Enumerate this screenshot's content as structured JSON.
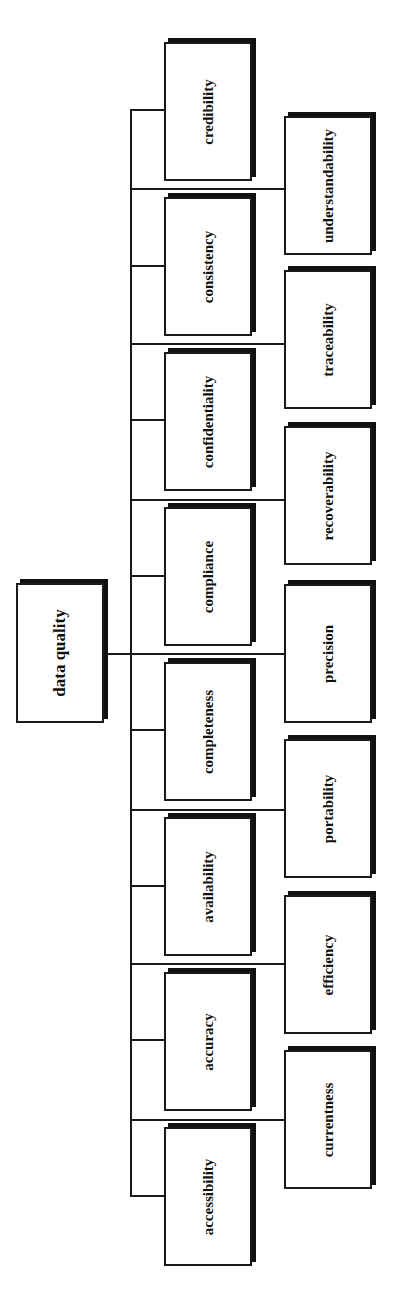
{
  "diagram": {
    "type": "tree",
    "orientation": "rotated-90ccw",
    "root": {
      "label": "data quality"
    },
    "children": [
      {
        "label": "accessibility"
      },
      {
        "label": "accuracy"
      },
      {
        "label": "availability"
      },
      {
        "label": "completeness"
      },
      {
        "label": "compliance"
      },
      {
        "label": "confidentiality"
      },
      {
        "label": "consistency"
      },
      {
        "label": "credibility"
      },
      {
        "label": "currentness"
      },
      {
        "label": "efficiency"
      },
      {
        "label": "portability"
      },
      {
        "label": "precision"
      },
      {
        "label": "recoverability"
      },
      {
        "label": "traceability"
      },
      {
        "label": "understandability"
      }
    ]
  },
  "colors": {
    "line": "#1a1a1a",
    "box_fill": "#ffffff",
    "shadow": "#111111"
  }
}
